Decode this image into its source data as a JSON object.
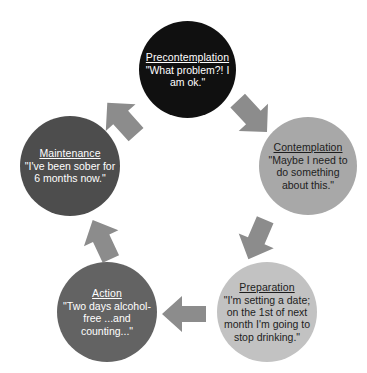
{
  "diagram": {
    "background_color": "#ffffff",
    "arrow_color": "#8c8c8c"
  },
  "stages": [
    {
      "id": "precontemplation",
      "label": "Precontemplation",
      "quote": "\"What problem?! I am ok.\"",
      "fill_color": "#101010",
      "text_color": "#ffffff"
    },
    {
      "id": "contemplation",
      "label": "Contemplation",
      "quote": "\"Maybe I need to do something about this.\"",
      "fill_color": "#a8a8a8",
      "text_color": "#1d1d1d"
    },
    {
      "id": "preparation",
      "label": "Preparation",
      "quote": "\"I'm setting a date; on the 1st of next month I'm going to stop drinking.\"",
      "fill_color": "#c2c2c2",
      "text_color": "#1d1d1d"
    },
    {
      "id": "action",
      "label": "Action",
      "quote": "\"Two days alcohol-free ...and counting...\"",
      "fill_color": "#636363",
      "text_color": "#ffffff"
    },
    {
      "id": "maintenance",
      "label": "Maintenance",
      "quote": "\"I've been sober for 6 months now.\"",
      "fill_color": "#4d4d4d",
      "text_color": "#ffffff"
    }
  ],
  "arrows": [
    {
      "id": "maintenance-to-precontemplation",
      "from": "Maintenance",
      "to": "Precontemplation",
      "direction": "up-right"
    },
    {
      "id": "precontemplation-to-contemplation",
      "from": "Precontemplation",
      "to": "Contemplation",
      "direction": "down-right"
    },
    {
      "id": "contemplation-to-preparation",
      "from": "Contemplation",
      "to": "Preparation",
      "direction": "down-left"
    },
    {
      "id": "preparation-to-action",
      "from": "Preparation",
      "to": "Action",
      "direction": "left"
    },
    {
      "id": "action-to-maintenance",
      "from": "Action",
      "to": "Maintenance",
      "direction": "up-left"
    }
  ]
}
